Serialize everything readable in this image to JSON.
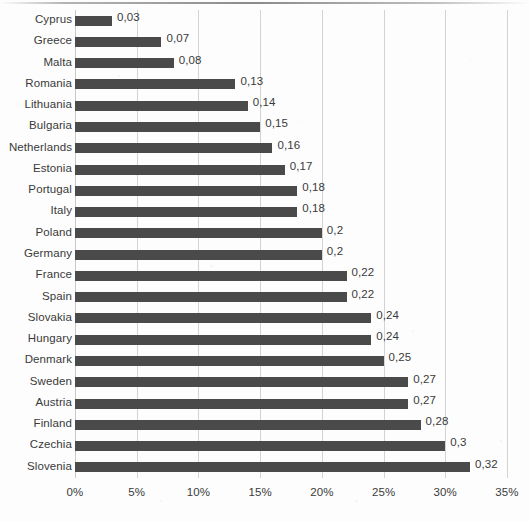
{
  "chart_data": {
    "type": "bar",
    "orientation": "horizontal",
    "title": "",
    "subtitle": "",
    "xlabel": "",
    "ylabel": "",
    "categories": [
      "Cyprus",
      "Greece",
      "Malta",
      "Romania",
      "Lithuania",
      "Bulgaria",
      "Netherlands",
      "Estonia",
      "Portugal",
      "Italy",
      "Poland",
      "Germany",
      "France",
      "Spain",
      "Slovakia",
      "Hungary",
      "Denmark",
      "Sweden",
      "Austria",
      "Finland",
      "Czechia",
      "Slovenia"
    ],
    "values": [
      0.03,
      0.07,
      0.08,
      0.13,
      0.14,
      0.15,
      0.16,
      0.17,
      0.18,
      0.18,
      0.2,
      0.2,
      0.22,
      0.22,
      0.24,
      0.24,
      0.25,
      0.27,
      0.27,
      0.28,
      0.3,
      0.32
    ],
    "data_labels": [
      "0,03",
      "0,07",
      "0,08",
      "0,13",
      "0,14",
      "0,15",
      "0,16",
      "0,17",
      "0,18",
      "0,18",
      "0,2",
      "0,2",
      "0,22",
      "0,22",
      "0,24",
      "0,24",
      "0,25",
      "0,27",
      "0,27",
      "0,28",
      "0,3",
      "0,32"
    ],
    "bar_scale_percent": [
      3,
      7,
      8,
      13,
      14,
      15,
      16,
      17,
      18,
      18,
      20,
      20,
      22,
      22,
      24,
      24,
      25,
      27,
      27,
      28,
      30,
      32
    ],
    "xlim": [
      0,
      35
    ],
    "xticks": [
      0,
      5,
      10,
      15,
      20,
      25,
      30,
      35
    ],
    "xtick_labels": [
      "0%",
      "5%",
      "10%",
      "15%",
      "20%",
      "25%",
      "30%",
      "35%"
    ],
    "grid": true,
    "grid_axis": "x",
    "legend": null,
    "legend_position": "none",
    "colors": {
      "bar": "#4a4a4a",
      "gridline": "#d3d3d3",
      "text": "#3a3a3a",
      "background": "#fdfdfd"
    }
  }
}
